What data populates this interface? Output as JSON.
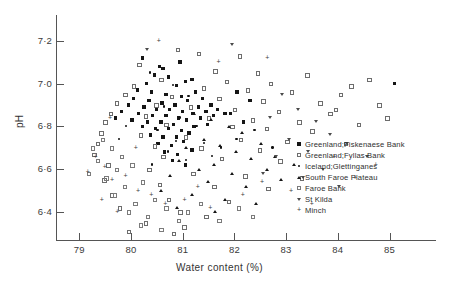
{
  "chart_data": {
    "type": "scatter",
    "title": "",
    "xlabel": "Water content (%)",
    "ylabel": "pH",
    "xlim": [
      78.55,
      85.9
    ],
    "ylim": [
      6.27,
      7.32
    ],
    "xticks": [
      79,
      80,
      81,
      82,
      83,
      84,
      85
    ],
    "xtick_labels": [
      "79",
      "80",
      "81",
      "82",
      "83",
      "84",
      "85"
    ],
    "yticks": [
      6.4,
      6.6,
      6.8,
      7.0,
      7.2
    ],
    "ytick_labels": [
      "6·4",
      "6·6",
      "6·8",
      "7·0",
      "7·2"
    ],
    "grid": false,
    "legend_position": "right-inside",
    "marker_colors": {
      "filled": "#151515",
      "open": "#6d6d6d",
      "accent": "#3d3d3d"
    },
    "series": [
      {
        "name": "Greenland;Fiskenaese Bank",
        "marker": "filled-square",
        "points": [
          [
            80.22,
            7.12
          ],
          [
            80.55,
            7.08
          ],
          [
            80.62,
            7.07
          ],
          [
            80.95,
            7.1
          ],
          [
            80.45,
            7.04
          ],
          [
            80.72,
            7.03
          ],
          [
            81.05,
            7.01
          ],
          [
            80.3,
            7.0
          ],
          [
            80.88,
            6.99
          ],
          [
            81.18,
            7.02
          ],
          [
            80.12,
            6.97
          ],
          [
            80.4,
            6.96
          ],
          [
            80.68,
            6.95
          ],
          [
            80.98,
            6.94
          ],
          [
            81.25,
            6.96
          ],
          [
            80.05,
            6.93
          ],
          [
            80.35,
            6.92
          ],
          [
            80.6,
            6.91
          ],
          [
            80.85,
            6.9
          ],
          [
            81.1,
            6.92
          ],
          [
            81.38,
            6.93
          ],
          [
            79.95,
            6.9
          ],
          [
            80.25,
            6.89
          ],
          [
            80.5,
            6.88
          ],
          [
            80.75,
            6.88
          ],
          [
            81.0,
            6.87
          ],
          [
            81.3,
            6.89
          ],
          [
            81.55,
            6.9
          ],
          [
            80.15,
            6.86
          ],
          [
            80.42,
            6.85
          ],
          [
            80.68,
            6.85
          ],
          [
            80.92,
            6.84
          ],
          [
            81.2,
            6.86
          ],
          [
            81.45,
            6.87
          ],
          [
            81.68,
            6.88
          ],
          [
            80.02,
            6.83
          ],
          [
            80.32,
            6.82
          ],
          [
            80.58,
            6.82
          ],
          [
            80.82,
            6.81
          ],
          [
            81.08,
            6.83
          ],
          [
            81.35,
            6.84
          ],
          [
            81.6,
            6.85
          ],
          [
            81.82,
            6.86
          ],
          [
            80.22,
            6.8
          ],
          [
            80.48,
            6.79
          ],
          [
            80.72,
            6.79
          ],
          [
            80.98,
            6.78
          ],
          [
            81.22,
            6.8
          ],
          [
            81.48,
            6.81
          ],
          [
            80.38,
            6.76
          ],
          [
            80.62,
            6.75
          ],
          [
            80.88,
            6.75
          ],
          [
            81.12,
            6.77
          ],
          [
            80.52,
            6.72
          ],
          [
            80.78,
            6.71
          ],
          [
            81.02,
            6.73
          ],
          [
            80.65,
            6.68
          ],
          [
            80.9,
            6.67
          ],
          [
            81.18,
            6.69
          ],
          [
            80.8,
            6.64
          ],
          [
            81.05,
            6.62
          ],
          [
            85.1,
            7.0
          ],
          [
            82.05,
            6.96
          ],
          [
            82.3,
            6.92
          ],
          [
            81.92,
            6.86
          ],
          [
            82.18,
            6.82
          ],
          [
            79.82,
            6.87
          ],
          [
            79.7,
            6.84
          ]
        ]
      },
      {
        "name": "Greenland;Fyllas Bank",
        "marker": "open-square",
        "points": [
          [
            80.9,
            7.16
          ],
          [
            81.3,
            7.14
          ],
          [
            82.1,
            7.13
          ],
          [
            80.15,
            7.09
          ],
          [
            81.62,
            7.06
          ],
          [
            82.45,
            7.05
          ],
          [
            83.4,
            7.04
          ],
          [
            84.6,
            7.02
          ],
          [
            80.58,
            7.02
          ],
          [
            81.85,
            7.01
          ],
          [
            82.7,
            7.0
          ],
          [
            84.25,
            6.99
          ],
          [
            80.05,
            6.99
          ],
          [
            81.4,
            6.98
          ],
          [
            82.25,
            6.97
          ],
          [
            83.1,
            6.96
          ],
          [
            84.05,
            6.95
          ],
          [
            79.88,
            6.95
          ],
          [
            80.78,
            6.94
          ],
          [
            81.7,
            6.93
          ],
          [
            82.55,
            6.92
          ],
          [
            83.65,
            6.91
          ],
          [
            84.8,
            6.9
          ],
          [
            79.72,
            6.91
          ],
          [
            80.48,
            6.9
          ],
          [
            81.15,
            6.89
          ],
          [
            82.0,
            6.88
          ],
          [
            82.85,
            6.87
          ],
          [
            83.85,
            6.86
          ],
          [
            79.6,
            6.86
          ],
          [
            80.28,
            6.85
          ],
          [
            81.5,
            6.84
          ],
          [
            82.35,
            6.83
          ],
          [
            83.25,
            6.82
          ],
          [
            84.4,
            6.81
          ],
          [
            79.5,
            6.82
          ],
          [
            80.68,
            6.81
          ],
          [
            81.95,
            6.8
          ],
          [
            82.62,
            6.79
          ],
          [
            83.5,
            6.78
          ],
          [
            79.42,
            6.77
          ],
          [
            80.18,
            6.76
          ],
          [
            81.05,
            6.75
          ],
          [
            82.12,
            6.74
          ],
          [
            83.02,
            6.73
          ],
          [
            84.15,
            6.72
          ],
          [
            79.35,
            6.72
          ],
          [
            80.45,
            6.71
          ],
          [
            81.35,
            6.7
          ],
          [
            82.48,
            6.69
          ],
          [
            79.28,
            6.67
          ],
          [
            80.62,
            6.66
          ],
          [
            81.75,
            6.65
          ],
          [
            82.88,
            6.64
          ],
          [
            79.55,
            6.62
          ],
          [
            80.35,
            6.6
          ],
          [
            81.2,
            6.58
          ],
          [
            82.2,
            6.57
          ],
          [
            83.3,
            6.56
          ],
          [
            79.48,
            6.55
          ],
          [
            80.55,
            6.53
          ],
          [
            81.6,
            6.52
          ],
          [
            82.65,
            6.51
          ],
          [
            79.62,
            6.48
          ],
          [
            80.72,
            6.46
          ],
          [
            81.88,
            6.45
          ],
          [
            79.78,
            6.42
          ],
          [
            80.95,
            6.4
          ],
          [
            81.45,
            6.38
          ],
          [
            80.28,
            6.35
          ],
          [
            81.02,
            6.33
          ],
          [
            79.95,
            6.31
          ],
          [
            80.82,
            6.3
          ],
          [
            83.95,
            6.88
          ],
          [
            84.95,
            6.84
          ]
        ]
      },
      {
        "name": "Iceland;Glettinganes",
        "marker": "small-dot",
        "points": [
          [
            80.38,
            7.05
          ],
          [
            80.82,
            6.99
          ],
          [
            81.12,
            6.94
          ],
          [
            80.65,
            6.89
          ],
          [
            80.95,
            6.84
          ],
          [
            81.28,
            6.8
          ],
          [
            80.52,
            6.78
          ],
          [
            80.88,
            6.73
          ],
          [
            81.42,
            6.72
          ],
          [
            80.72,
            6.68
          ],
          [
            81.08,
            6.64
          ],
          [
            81.58,
            6.66
          ],
          [
            80.42,
            6.62
          ],
          [
            81.75,
            6.7
          ],
          [
            82.05,
            6.74
          ],
          [
            79.92,
            6.8
          ],
          [
            79.78,
            6.74
          ],
          [
            82.4,
            6.78
          ],
          [
            82.75,
            6.7
          ]
        ]
      },
      {
        "name": "South Faroe Plateau",
        "marker": "filled-triangle",
        "points": [
          [
            81.22,
            6.86
          ],
          [
            81.55,
            6.83
          ],
          [
            81.88,
            6.8
          ],
          [
            82.15,
            6.77
          ],
          [
            81.4,
            6.74
          ],
          [
            81.72,
            6.71
          ],
          [
            82.02,
            6.68
          ],
          [
            82.32,
            6.65
          ],
          [
            81.05,
            6.7
          ],
          [
            81.6,
            6.62
          ],
          [
            82.5,
            6.72
          ],
          [
            82.78,
            6.66
          ],
          [
            80.92,
            6.64
          ],
          [
            81.3,
            6.6
          ],
          [
            81.95,
            6.58
          ],
          [
            82.62,
            6.6
          ],
          [
            80.75,
            6.57
          ],
          [
            81.48,
            6.54
          ],
          [
            82.22,
            6.52
          ],
          [
            80.58,
            6.5
          ],
          [
            81.18,
            6.48
          ],
          [
            81.82,
            6.46
          ],
          [
            82.42,
            6.44
          ],
          [
            80.88,
            6.42
          ],
          [
            81.62,
            6.4
          ],
          [
            82.9,
            6.55
          ],
          [
            83.15,
            6.62
          ]
        ]
      },
      {
        "name": "Faroe Bank",
        "marker": "open-square-2",
        "points": [
          [
            79.45,
            6.74
          ],
          [
            79.62,
            6.7
          ],
          [
            79.82,
            6.66
          ],
          [
            79.35,
            6.64
          ],
          [
            79.72,
            6.6
          ],
          [
            80.02,
            6.62
          ],
          [
            79.52,
            6.56
          ],
          [
            79.88,
            6.52
          ],
          [
            80.22,
            6.54
          ],
          [
            79.68,
            6.48
          ],
          [
            80.08,
            6.44
          ],
          [
            80.45,
            6.46
          ],
          [
            79.95,
            6.4
          ],
          [
            80.32,
            6.38
          ],
          [
            80.68,
            6.42
          ],
          [
            80.18,
            6.34
          ],
          [
            80.58,
            6.32
          ],
          [
            80.92,
            6.36
          ],
          [
            79.25,
            6.7
          ],
          [
            79.18,
            6.58
          ],
          [
            81.1,
            6.4
          ],
          [
            81.35,
            6.44
          ],
          [
            81.7,
            6.36
          ],
          [
            82.08,
            6.42
          ],
          [
            82.35,
            6.38
          ]
        ]
      },
      {
        "name": "St Kilda",
        "marker": "inverted-triangle",
        "points": [
          [
            82.92,
            6.95
          ],
          [
            83.22,
            6.88
          ],
          [
            83.58,
            6.82
          ],
          [
            82.68,
            6.84
          ],
          [
            83.85,
            6.76
          ],
          [
            83.05,
            6.74
          ],
          [
            83.42,
            6.68
          ],
          [
            82.8,
            6.66
          ],
          [
            83.7,
            6.6
          ],
          [
            84.18,
            6.72
          ],
          [
            84.55,
            6.66
          ],
          [
            83.32,
            6.56
          ],
          [
            82.55,
            6.58
          ],
          [
            84.02,
            6.52
          ],
          [
            80.3,
            7.16
          ],
          [
            81.95,
            7.18
          ]
        ]
      },
      {
        "name": "Minch",
        "marker": "plus",
        "points": [
          [
            79.3,
            6.66
          ],
          [
            79.48,
            6.61
          ],
          [
            79.15,
            6.59
          ],
          [
            79.62,
            6.55
          ],
          [
            79.88,
            6.57
          ],
          [
            80.12,
            6.5
          ],
          [
            79.42,
            6.46
          ],
          [
            80.38,
            6.48
          ],
          [
            80.65,
            6.44
          ],
          [
            79.72,
            6.4
          ],
          [
            81.02,
            6.46
          ],
          [
            81.28,
            6.52
          ],
          [
            81.52,
            6.42
          ],
          [
            82.15,
            6.48
          ],
          [
            82.52,
            6.54
          ],
          [
            83.08,
            6.5
          ],
          [
            83.48,
            6.44
          ],
          [
            84.32,
            6.56
          ],
          [
            84.72,
            6.62
          ],
          [
            83.92,
            6.66
          ],
          [
            80.52,
            7.2
          ],
          [
            81.68,
            7.1
          ],
          [
            82.62,
            7.12
          ],
          [
            79.58,
            6.84
          ],
          [
            80.08,
            6.7
          ]
        ]
      }
    ]
  },
  "legend": {
    "items": [
      {
        "label": "Greenland;Fiskenaese Bank",
        "marker": "filled-square"
      },
      {
        "label": "Greenland;Fyllas Bank",
        "marker": "open-square"
      },
      {
        "label": "Iceland;Glettinganes",
        "marker": "small-dot"
      },
      {
        "label": "South Faroe Plateau",
        "marker": "filled-triangle"
      },
      {
        "label": "Faroe Bank",
        "marker": "open-square-2"
      },
      {
        "label": "St Kilda",
        "marker": "inverted-triangle"
      },
      {
        "label": "Minch",
        "marker": "plus"
      }
    ]
  }
}
